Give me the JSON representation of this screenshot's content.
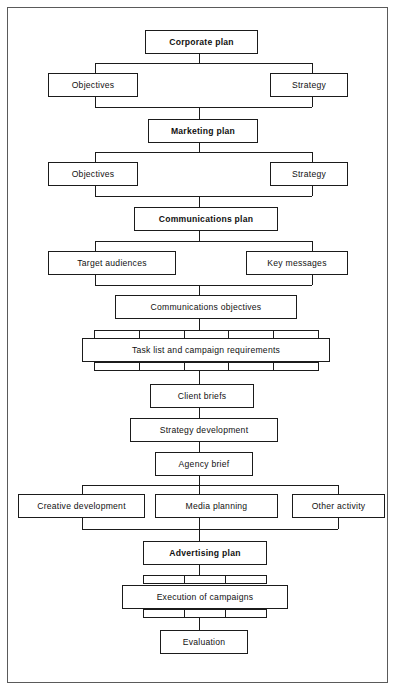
{
  "diagram": {
    "stroke_color": "#1b1b1b",
    "frame_color": "#5a5a5a",
    "background": "#ffffff",
    "nodes": [
      {
        "id": "corporate-plan",
        "label": "Corporate plan",
        "bold": true
      },
      {
        "id": "corporate-objectives",
        "label": "Objectives",
        "bold": false
      },
      {
        "id": "corporate-strategy",
        "label": "Strategy",
        "bold": false
      },
      {
        "id": "marketing-plan",
        "label": "Marketing plan",
        "bold": true
      },
      {
        "id": "marketing-objectives",
        "label": "Objectives",
        "bold": false
      },
      {
        "id": "marketing-strategy",
        "label": "Strategy",
        "bold": false
      },
      {
        "id": "communications-plan",
        "label": "Communications plan",
        "bold": true
      },
      {
        "id": "target-audiences",
        "label": "Target audiences",
        "bold": false
      },
      {
        "id": "key-messages",
        "label": "Key messages",
        "bold": false
      },
      {
        "id": "communications-objectives",
        "label": "Communications objectives",
        "bold": false
      },
      {
        "id": "task-list",
        "label": "Task list and campaign requirements",
        "bold": false
      },
      {
        "id": "client-briefs",
        "label": "Client briefs",
        "bold": false
      },
      {
        "id": "strategy-development",
        "label": "Strategy development",
        "bold": false
      },
      {
        "id": "agency-brief",
        "label": "Agency brief",
        "bold": false
      },
      {
        "id": "creative-development",
        "label": "Creative development",
        "bold": false
      },
      {
        "id": "media-planning",
        "label": "Media planning",
        "bold": false
      },
      {
        "id": "other-activity",
        "label": "Other activity",
        "bold": false
      },
      {
        "id": "advertising-plan",
        "label": "Advertising plan",
        "bold": true
      },
      {
        "id": "execution-of-campaigns",
        "label": "Execution of campaigns",
        "bold": false
      },
      {
        "id": "evaluation",
        "label": "Evaluation",
        "bold": false
      }
    ],
    "comb_counts": {
      "task_list_top": 5,
      "task_list_bottom": 5,
      "execution_top": 3,
      "execution_bottom": 3
    }
  }
}
